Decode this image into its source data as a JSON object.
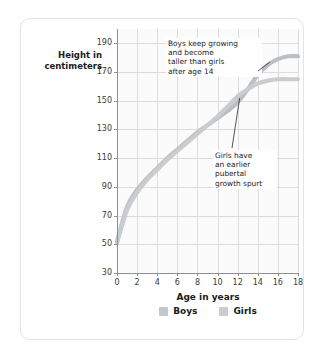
{
  "card": {
    "background": "#ffffff",
    "border_color": "#e3e3e3"
  },
  "chart_data": {
    "type": "line",
    "title": "",
    "xlabel": "Age in years",
    "ylabel": "Height in centimeters",
    "xlim": [
      0,
      18
    ],
    "ylim": [
      30,
      200
    ],
    "grid": true,
    "legend_position": "bottom",
    "xticks": [
      "0",
      "2",
      "4",
      "6",
      "8",
      "10",
      "12",
      "14",
      "16",
      "18"
    ],
    "yticks": [
      "30",
      "50",
      "70",
      "90",
      "110",
      "130",
      "150",
      "170",
      "190"
    ],
    "x": [
      0,
      1,
      2,
      3,
      4,
      5,
      6,
      7,
      8,
      9,
      10,
      11,
      12,
      13,
      14,
      15,
      16,
      17,
      18
    ],
    "series": [
      {
        "name": "Boys",
        "color": "#b9bfc4",
        "values": [
          52,
          76,
          88,
          96,
          103,
          110,
          116,
          122,
          128,
          133,
          138,
          143,
          149,
          158,
          168,
          175,
          179,
          181,
          181
        ]
      },
      {
        "name": "Girls",
        "color": "#c9cdd0",
        "values": [
          51,
          74,
          86,
          95,
          102,
          109,
          115,
          121,
          127,
          133,
          139,
          146,
          153,
          158,
          162,
          164,
          165,
          165,
          165
        ]
      }
    ],
    "annotations": [
      {
        "id": "boys-note",
        "text": "Boys keep growing\nand become\ntaller than girls\nafter age 14",
        "points_to": {
          "x": 15.2,
          "y": 177
        }
      },
      {
        "id": "girls-note",
        "text": "Girls have\nan earlier\npubertal\ngrowth spurt",
        "points_to": {
          "x": 12.2,
          "y": 152
        }
      }
    ]
  },
  "legend": {
    "items": [
      {
        "label": "Boys",
        "color": "#c3c8cc"
      },
      {
        "label": "Girls",
        "color": "#c9cdd0"
      }
    ]
  }
}
